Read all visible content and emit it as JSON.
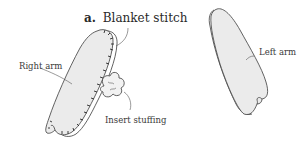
{
  "figure": {
    "step_marker": "a.",
    "step_title": "Blanket stitch",
    "labels": {
      "right_arm": "Right arm",
      "insert_stuffing": "Insert stuffing",
      "left_arm": "Left arm"
    },
    "icons": [
      "right-arm-piece",
      "stuffing-icon",
      "left-arm-piece",
      "blanket-stitch-marks"
    ],
    "colors": {
      "fabric_fill": "#ebebeb",
      "outline": "#3c3c3c",
      "text": "#3a3a3a",
      "background": "#ffffff"
    }
  }
}
